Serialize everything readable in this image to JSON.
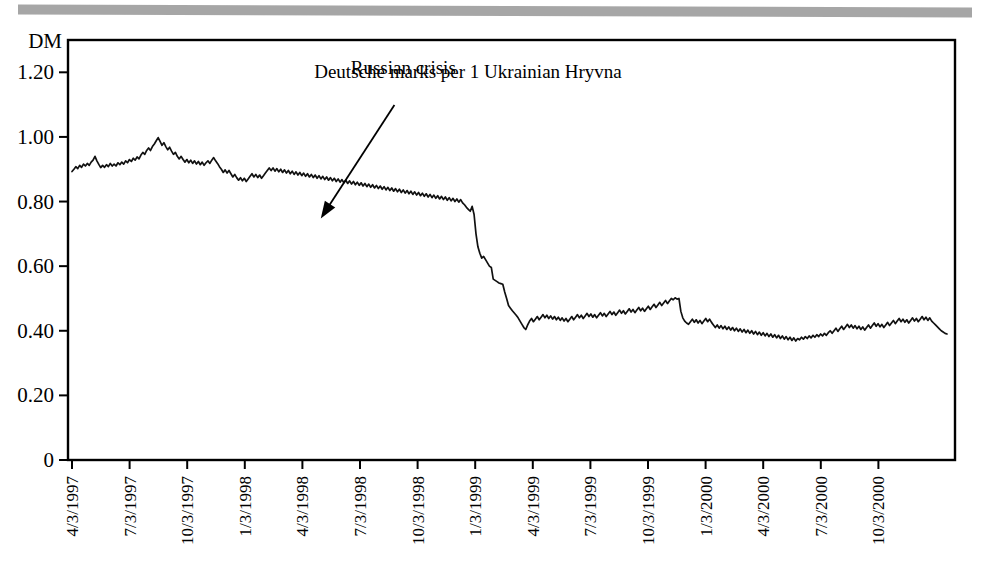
{
  "figure": {
    "scan_bar": "scanned-page-edge-artifact",
    "background_color": "#ffffff",
    "line_color": "#111111",
    "axis_color": "#000000"
  },
  "chart_data": {
    "type": "line",
    "title": "Deutsche marks per 1 Ukrainian Hryvna",
    "xlabel": "",
    "ylabel": "DM",
    "ylim": [
      0,
      1.3
    ],
    "yticks": [
      0,
      0.2,
      0.4,
      0.6,
      0.8,
      1.0,
      1.2
    ],
    "ytick_labels": [
      "0",
      "0.20",
      "0.40",
      "0.60",
      "0.80",
      "1.00",
      "1.20"
    ],
    "grid": false,
    "legend": "none",
    "xtick_labels": [
      "4/3/1997",
      "7/3/1997",
      "10/3/1997",
      "1/3/1998",
      "4/3/1998",
      "7/3/1998",
      "10/3/1998",
      "1/3/1999",
      "4/3/1999",
      "7/3/1999",
      "10/3/1999",
      "1/3/2000",
      "4/3/2000",
      "7/3/2000",
      "10/3/2000"
    ],
    "annotations": [
      {
        "text": "Russian crisis",
        "label_x": 0.378,
        "label_y": 0.92,
        "arrow_from_x": 0.368,
        "arrow_from_y": 0.845,
        "arrow_to_x": 0.285,
        "arrow_to_y": 0.575
      }
    ],
    "series": [
      {
        "name": "DM per 1 UAH",
        "values": [
          0.893,
          0.9,
          0.908,
          0.902,
          0.912,
          0.906,
          0.916,
          0.91,
          0.918,
          0.912,
          0.922,
          0.928,
          0.94,
          0.926,
          0.915,
          0.905,
          0.912,
          0.906,
          0.914,
          0.908,
          0.918,
          0.91,
          0.916,
          0.91,
          0.92,
          0.914,
          0.922,
          0.916,
          0.926,
          0.92,
          0.93,
          0.924,
          0.934,
          0.928,
          0.938,
          0.932,
          0.944,
          0.952,
          0.946,
          0.958,
          0.966,
          0.958,
          0.97,
          0.978,
          0.988,
          0.998,
          0.986,
          0.974,
          0.982,
          0.97,
          0.96,
          0.968,
          0.956,
          0.946,
          0.952,
          0.94,
          0.932,
          0.94,
          0.93,
          0.922,
          0.93,
          0.92,
          0.928,
          0.918,
          0.926,
          0.916,
          0.924,
          0.914,
          0.922,
          0.912,
          0.92,
          0.926,
          0.918,
          0.928,
          0.936,
          0.926,
          0.918,
          0.908,
          0.9,
          0.89,
          0.898,
          0.888,
          0.896,
          0.886,
          0.876,
          0.884,
          0.874,
          0.866,
          0.874,
          0.864,
          0.872,
          0.862,
          0.87,
          0.878,
          0.886,
          0.876,
          0.884,
          0.874,
          0.882,
          0.872,
          0.88,
          0.888,
          0.896,
          0.904,
          0.896,
          0.904,
          0.894,
          0.902,
          0.892,
          0.9,
          0.89,
          0.898,
          0.888,
          0.896,
          0.886,
          0.894,
          0.884,
          0.892,
          0.882,
          0.89,
          0.88,
          0.888,
          0.878,
          0.886,
          0.876,
          0.884,
          0.874,
          0.882,
          0.872,
          0.88,
          0.87,
          0.878,
          0.868,
          0.876,
          0.866,
          0.874,
          0.864,
          0.872,
          0.862,
          0.87,
          0.86,
          0.868,
          0.858,
          0.866,
          0.856,
          0.864,
          0.854,
          0.862,
          0.852,
          0.86,
          0.85,
          0.858,
          0.848,
          0.856,
          0.846,
          0.854,
          0.844,
          0.852,
          0.842,
          0.85,
          0.84,
          0.848,
          0.838,
          0.846,
          0.836,
          0.844,
          0.834,
          0.842,
          0.832,
          0.84,
          0.83,
          0.838,
          0.828,
          0.836,
          0.826,
          0.834,
          0.824,
          0.832,
          0.822,
          0.83,
          0.82,
          0.828,
          0.818,
          0.826,
          0.816,
          0.824,
          0.814,
          0.822,
          0.812,
          0.82,
          0.81,
          0.818,
          0.808,
          0.816,
          0.806,
          0.814,
          0.804,
          0.812,
          0.802,
          0.81,
          0.8,
          0.808,
          0.798,
          0.806,
          0.796,
          0.79,
          0.782,
          0.776,
          0.77,
          0.785,
          0.76,
          0.7,
          0.66,
          0.64,
          0.625,
          0.63,
          0.62,
          0.61,
          0.6,
          0.596,
          0.56,
          0.556,
          0.552,
          0.548,
          0.546,
          0.544,
          0.52,
          0.5,
          0.478,
          0.47,
          0.462,
          0.455,
          0.448,
          0.44,
          0.43,
          0.42,
          0.41,
          0.404,
          0.418,
          0.43,
          0.438,
          0.428,
          0.436,
          0.444,
          0.434,
          0.442,
          0.45,
          0.44,
          0.448,
          0.438,
          0.446,
          0.436,
          0.444,
          0.434,
          0.442,
          0.432,
          0.44,
          0.43,
          0.438,
          0.428,
          0.436,
          0.444,
          0.434,
          0.442,
          0.45,
          0.44,
          0.448,
          0.438,
          0.446,
          0.454,
          0.444,
          0.452,
          0.442,
          0.45,
          0.44,
          0.448,
          0.456,
          0.446,
          0.454,
          0.444,
          0.452,
          0.46,
          0.45,
          0.458,
          0.448,
          0.456,
          0.464,
          0.454,
          0.462,
          0.452,
          0.46,
          0.468,
          0.458,
          0.466,
          0.456,
          0.464,
          0.472,
          0.462,
          0.47,
          0.46,
          0.468,
          0.476,
          0.466,
          0.474,
          0.482,
          0.472,
          0.48,
          0.488,
          0.478,
          0.486,
          0.494,
          0.484,
          0.492,
          0.5,
          0.496,
          0.502,
          0.498,
          0.5,
          0.46,
          0.44,
          0.43,
          0.424,
          0.42,
          0.428,
          0.436,
          0.426,
          0.434,
          0.424,
          0.432,
          0.422,
          0.43,
          0.438,
          0.428,
          0.436,
          0.426,
          0.418,
          0.41,
          0.418,
          0.408,
          0.416,
          0.406,
          0.414,
          0.404,
          0.412,
          0.402,
          0.41,
          0.4,
          0.408,
          0.398,
          0.406,
          0.396,
          0.404,
          0.394,
          0.402,
          0.392,
          0.4,
          0.39,
          0.398,
          0.388,
          0.396,
          0.386,
          0.394,
          0.384,
          0.392,
          0.382,
          0.39,
          0.38,
          0.388,
          0.378,
          0.386,
          0.376,
          0.384,
          0.374,
          0.382,
          0.372,
          0.38,
          0.37,
          0.378,
          0.368,
          0.376,
          0.372,
          0.38,
          0.374,
          0.382,
          0.376,
          0.384,
          0.378,
          0.386,
          0.38,
          0.388,
          0.382,
          0.39,
          0.384,
          0.392,
          0.386,
          0.394,
          0.4,
          0.392,
          0.4,
          0.408,
          0.398,
          0.406,
          0.414,
          0.404,
          0.412,
          0.42,
          0.41,
          0.418,
          0.408,
          0.416,
          0.406,
          0.414,
          0.404,
          0.412,
          0.402,
          0.41,
          0.418,
          0.408,
          0.416,
          0.424,
          0.414,
          0.422,
          0.412,
          0.42,
          0.41,
          0.418,
          0.426,
          0.416,
          0.424,
          0.432,
          0.422,
          0.43,
          0.438,
          0.428,
          0.436,
          0.426,
          0.434,
          0.424,
          0.432,
          0.44,
          0.43,
          0.438,
          0.428,
          0.436,
          0.444,
          0.434,
          0.442,
          0.432,
          0.44,
          0.43,
          0.424,
          0.418,
          0.412,
          0.406,
          0.4,
          0.396,
          0.392,
          0.39
        ]
      }
    ]
  }
}
